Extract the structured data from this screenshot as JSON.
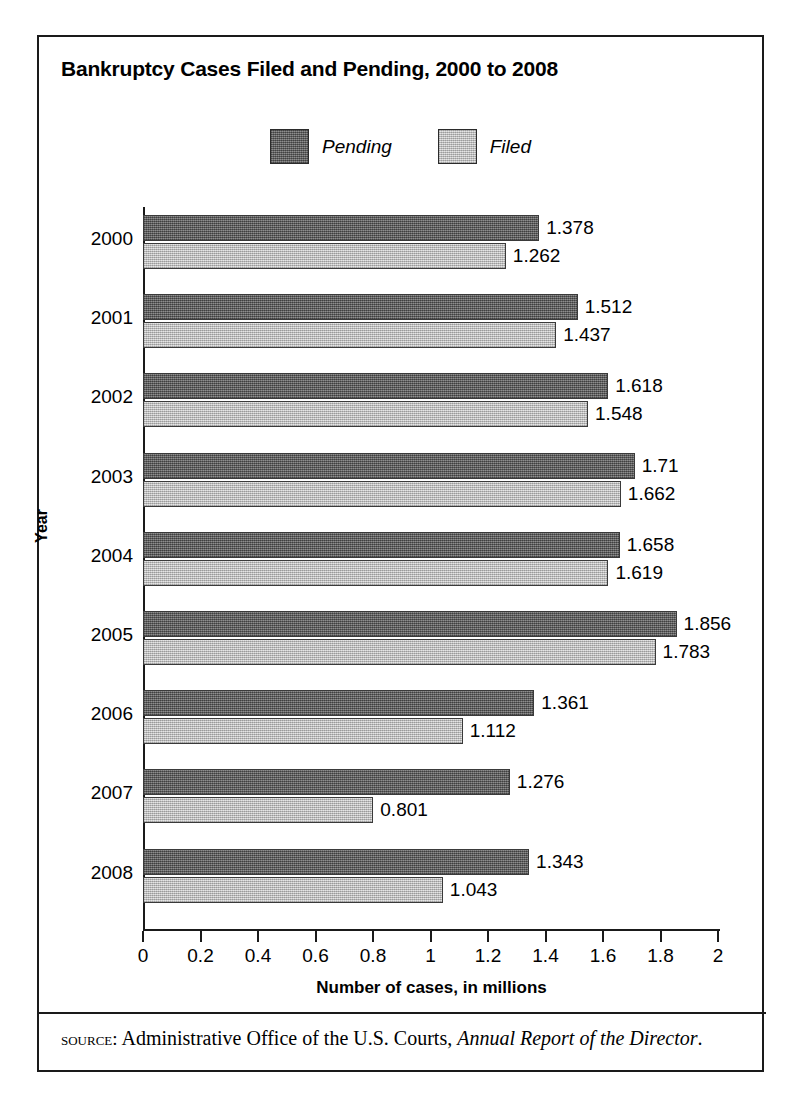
{
  "figure": {
    "title": "Bankruptcy Cases Filed and Pending, 2000 to 2008",
    "source_kicker": "source:",
    "source_text": " Administrative Office of the U.S. Courts, ",
    "source_italic": "Annual Report of the Director",
    "source_period": "."
  },
  "chart_data": {
    "type": "bar",
    "orientation": "horizontal",
    "title": "Bankruptcy Cases Filed and Pending, 2000 to 2008",
    "xlabel": "Number of cases, in millions",
    "ylabel": "Year",
    "categories": [
      "2000",
      "2001",
      "2002",
      "2003",
      "2004",
      "2005",
      "2006",
      "2007",
      "2008"
    ],
    "series": [
      {
        "name": "Pending",
        "color": "#6d6d6d",
        "values": [
          1.378,
          1.512,
          1.618,
          1.71,
          1.658,
          1.856,
          1.361,
          1.276,
          1.343
        ],
        "labels": [
          "1.378",
          "1.512",
          "1.618",
          "1.71",
          "1.658",
          "1.856",
          "1.361",
          "1.276",
          "1.343"
        ]
      },
      {
        "name": "Filed",
        "color": "#d0d0d0",
        "values": [
          1.262,
          1.437,
          1.548,
          1.662,
          1.619,
          1.783,
          1.112,
          0.801,
          1.043
        ],
        "labels": [
          "1.262",
          "1.437",
          "1.548",
          "1.662",
          "1.619",
          "1.783",
          "1.112",
          "0.801",
          "1.043"
        ]
      }
    ],
    "xlim": [
      0,
      2
    ],
    "xticks": [
      0,
      0.2,
      0.4,
      0.6,
      0.8,
      1,
      1.2,
      1.4,
      1.6,
      1.8,
      2
    ],
    "xtick_labels": [
      "0",
      "0.2",
      "0.4",
      "0.6",
      "0.8",
      "1",
      "1.2",
      "1.4",
      "1.6",
      "1.8",
      "2"
    ],
    "grid": false,
    "legend": {
      "position": "top-center",
      "entries": [
        "Pending",
        "Filed"
      ]
    }
  }
}
